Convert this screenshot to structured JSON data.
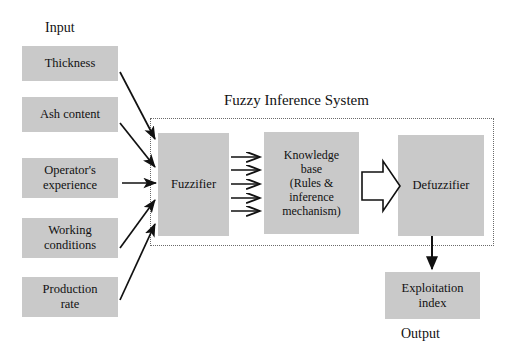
{
  "diagram": {
    "title": "Fuzzy Inference System",
    "input_label": "Input",
    "output_label": "Output",
    "colors": {
      "box_fill": "#c9c9c9",
      "stroke": "#111111",
      "border_dotted": "#6a6a6a",
      "background": "#ffffff"
    },
    "inputs": [
      {
        "label": "Thickness"
      },
      {
        "label": "Ash content"
      },
      {
        "label": "Operator's\nexperience"
      },
      {
        "label": "Working\nconditions"
      },
      {
        "label": "Production\nrate"
      }
    ],
    "fis_blocks": [
      {
        "label": "Fuzzifier"
      },
      {
        "label": "Knowledge\nbase\n(Rules &\ninference\nmechanism)"
      },
      {
        "label": "Defuzzifier"
      }
    ],
    "output": {
      "label": "Exploitation\nindex"
    },
    "connectors": {
      "fuzzifier_to_knowledge_count": 5,
      "knowledge_to_defuzzifier": "block-arrow",
      "defuzzifier_to_output": "down-arrow"
    }
  }
}
